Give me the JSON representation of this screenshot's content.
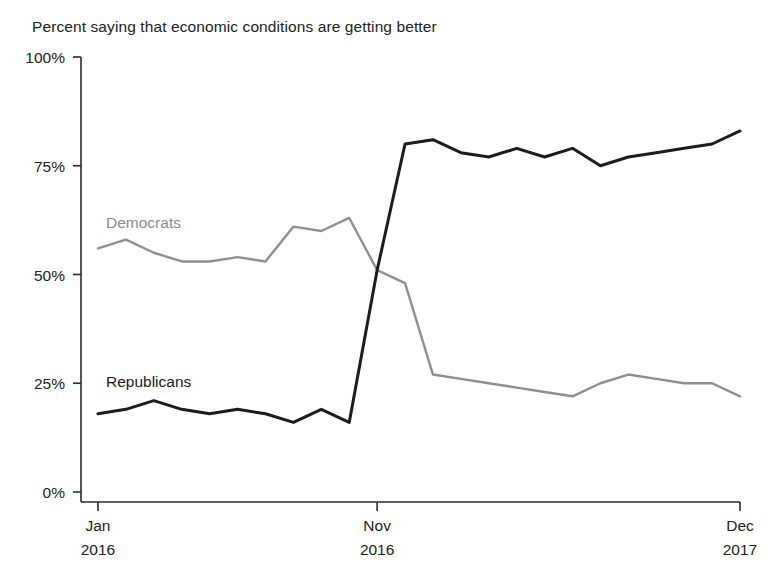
{
  "chart_data": {
    "type": "line",
    "title": "Percent saying that economic conditions are getting better",
    "xlabel": "",
    "ylabel": "",
    "ylim": [
      0,
      100
    ],
    "grid": false,
    "legend_position": "inline-series-labels",
    "y_ticks": [
      "0%",
      "25%",
      "50%",
      "75%",
      "100%"
    ],
    "y_tick_values": [
      0,
      25,
      50,
      75,
      100
    ],
    "x_ticks": [
      {
        "label_month": "Jan",
        "label_year": "2016",
        "index": 0
      },
      {
        "label_month": "Nov",
        "label_year": "2016",
        "index": 10
      },
      {
        "label_month": "Dec",
        "label_year": "2017",
        "index": 23
      }
    ],
    "x": [
      "Jan 2016",
      "Feb 2016",
      "Mar 2016",
      "Apr 2016",
      "May 2016",
      "Jun 2016",
      "Jul 2016",
      "Aug 2016",
      "Sep 2016",
      "Oct 2016",
      "Nov 2016",
      "Dec 2016",
      "Jan 2017",
      "Feb 2017",
      "Mar 2017",
      "Apr 2017",
      "May 2017",
      "Jun 2017",
      "Jul 2017",
      "Aug 2017",
      "Sep 2017",
      "Oct 2017",
      "Nov 2017",
      "Dec 2017"
    ],
    "series": [
      {
        "name": "Republicans",
        "color": "#1c1c1c",
        "label_text": "Republicans",
        "values": [
          18,
          19,
          21,
          19,
          18,
          19,
          18,
          16,
          19,
          16,
          51,
          80,
          81,
          78,
          77,
          79,
          77,
          79,
          75,
          77,
          78,
          79,
          80,
          83
        ]
      },
      {
        "name": "Democrats",
        "color": "#8f8f8f",
        "label_text": "Democrats",
        "values": [
          56,
          58,
          55,
          53,
          53,
          54,
          53,
          61,
          60,
          63,
          51,
          48,
          27,
          26,
          25,
          24,
          23,
          22,
          25,
          27,
          26,
          25,
          25,
          22
        ]
      }
    ]
  },
  "annotations": {
    "democrats_label": "Democrats",
    "republicans_label": "Republicans"
  }
}
